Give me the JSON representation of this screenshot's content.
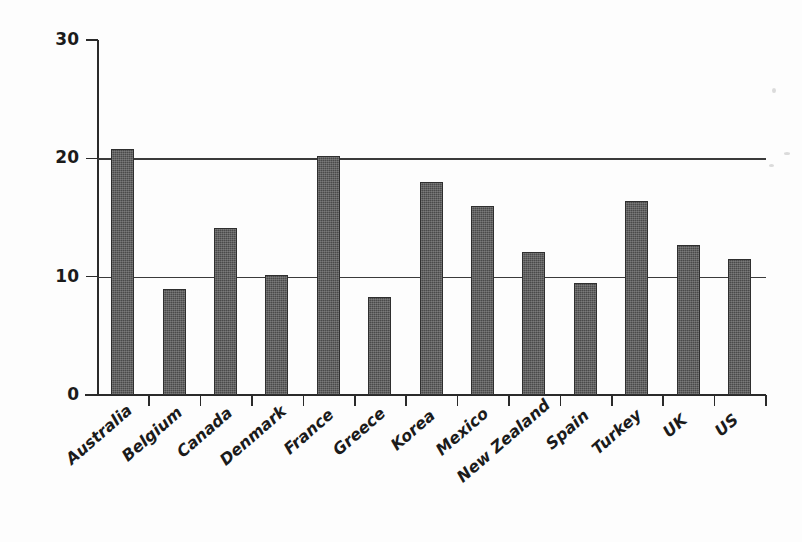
{
  "chart_data": {
    "type": "bar",
    "title": "",
    "subtitle": "",
    "xlabel": "",
    "ylabel": "Rate of Return (%)",
    "ylim": [
      0,
      30
    ],
    "yticks": [
      0,
      10,
      20,
      30
    ],
    "ytick_labels": [
      "0",
      "10",
      "20",
      "30"
    ],
    "gridlines": [
      10,
      20
    ],
    "grid": true,
    "legend": null,
    "legend_position": "none",
    "bar_color": "#4a4a4a",
    "axis_color": "#2a2a2a",
    "background_color": "#ffffff",
    "categories": [
      "Australia",
      "Belgium",
      "Canada",
      "Denmark",
      "France",
      "Greece",
      "Korea",
      "Mexico",
      "New Zealand",
      "Spain",
      "Turkey",
      "UK",
      "US"
    ],
    "values": [
      20.8,
      9.0,
      14.1,
      10.1,
      20.2,
      8.3,
      18.0,
      16.0,
      12.1,
      9.5,
      16.4,
      12.7,
      11.5
    ],
    "annotations": []
  }
}
